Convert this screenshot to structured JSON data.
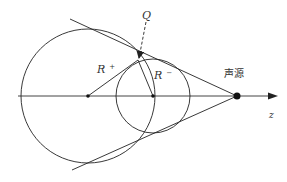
{
  "diagram": {
    "labels": {
      "Q": "Q",
      "R_plus_base": "R",
      "R_plus_sup": "+",
      "R_minus_base": "R",
      "R_minus_sup": "−",
      "source": "声源",
      "axis": "z"
    },
    "geometry": {
      "axis": {
        "x1": 18,
        "y": 96,
        "x2": 276
      },
      "big_circle": {
        "cx": 88,
        "cy": 96,
        "r": 67
      },
      "small_circle": {
        "cx": 153,
        "cy": 96,
        "r": 37
      },
      "source_point": {
        "x": 237,
        "y": 96
      },
      "contact_point": {
        "x": 138,
        "y": 60
      },
      "q_start": {
        "x": 146,
        "y": 22
      }
    },
    "colors": {
      "stroke": "#222222",
      "text": "#333333",
      "background": "#ffffff"
    }
  }
}
